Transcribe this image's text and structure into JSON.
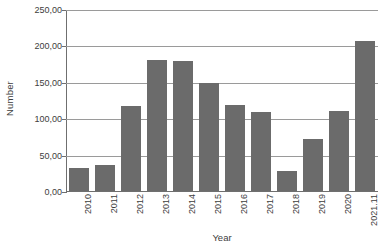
{
  "chart_data": {
    "type": "bar",
    "title": "",
    "xlabel": "Year",
    "ylabel": "Number",
    "categories": [
      "2010",
      "2011",
      "2012",
      "2013",
      "2014",
      "2015",
      "2016",
      "2017",
      "2018",
      "2019",
      "2020",
      "2021.11"
    ],
    "values": [
      32,
      36,
      117,
      180,
      178,
      148,
      118,
      108,
      28,
      72,
      110,
      206
    ],
    "ylim": [
      0,
      250
    ],
    "yticks": [
      0,
      50,
      100,
      150,
      200,
      250
    ],
    "ytick_labels": [
      "0,00",
      "50,00",
      "100,00",
      "150,00",
      "200,00",
      "250,00"
    ],
    "grid": true,
    "legend": "none",
    "series_color": "#6b6b6b",
    "axis_color": "#6f6f6f",
    "gridline_color": "#9a9a9a",
    "background_color": "#ffffff",
    "decimal_separator": ","
  }
}
